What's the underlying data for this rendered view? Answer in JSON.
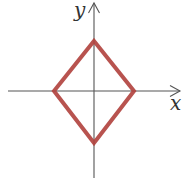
{
  "figure": {
    "type": "diamond on coordinate axes",
    "axes": {
      "x_label": "x",
      "y_label": "y",
      "color": "#555555",
      "origin": {
        "px": 94,
        "py": 91
      }
    },
    "shape": {
      "name": "rhombus",
      "stroke_color": "#b0403c",
      "vertices": {
        "top": [
          0,
          1
        ],
        "right": [
          1,
          0
        ],
        "bottom": [
          0,
          -1
        ],
        "left": [
          -1,
          0
        ]
      }
    }
  }
}
